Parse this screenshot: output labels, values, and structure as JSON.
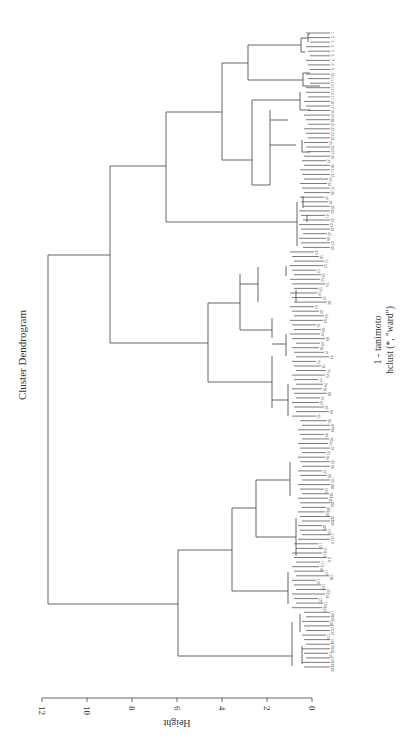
{
  "chart_data": {
    "type": "dendrogram",
    "orientation": "rotated 90 degrees clockwise (height axis runs horizontally at bottom, 12 on left to 0 on right; leaves on right edge)",
    "title": "Cluster Dendrogram",
    "xlabel": "1 - tanimoto",
    "sublabel": "hclust (*, \"ward\")",
    "ylabel": "Height",
    "ylim": [
      0,
      12
    ],
    "yticks": [
      0,
      2,
      4,
      6,
      8,
      10,
      12
    ],
    "ytick_labels": [
      "0",
      "2",
      "4",
      "6",
      "8",
      "10",
      "12"
    ],
    "grid": false,
    "legend": null,
    "approx_leaf_count": 140,
    "legible_leaf_labels": [
      "59",
      "82",
      "96",
      "107",
      "99"
    ],
    "merges": [
      {
        "id": "root",
        "height": 11.8,
        "children": [
          "A",
          "B"
        ]
      },
      {
        "id": "A",
        "height": 9.0,
        "children": [
          "A1",
          "A2"
        ]
      },
      {
        "id": "A1",
        "height": 6.5,
        "children": [
          "A1a",
          "A1b"
        ]
      },
      {
        "id": "A1a",
        "height": 4.0,
        "children": [
          "A1a-top",
          "A1a-bottom"
        ]
      },
      {
        "id": "A1a-top",
        "height": 2.8
      },
      {
        "id": "A1a-bottom",
        "height": 2.7
      },
      {
        "id": "A1b",
        "height": 0.7
      },
      {
        "id": "A2",
        "height": 4.6,
        "children": [
          "A2a",
          "A2b"
        ]
      },
      {
        "id": "A2a",
        "height": 3.2
      },
      {
        "id": "A2b",
        "height": 2.6
      },
      {
        "id": "B",
        "height": 5.9,
        "children": [
          "B1",
          "B2"
        ]
      },
      {
        "id": "B1",
        "height": 3.5,
        "children": [
          "B1a",
          "B1b"
        ]
      },
      {
        "id": "B1a",
        "height": 2.4
      },
      {
        "id": "B1b",
        "height": 1.0
      },
      {
        "id": "B2",
        "height": 0.85
      }
    ]
  },
  "labels": {
    "title": "Cluster Dendrogram",
    "xlabel": "1 - tanimoto",
    "sublabel": "hclust (*, \"ward\")",
    "ylabel": "Height",
    "ticks": [
      "12",
      "10",
      "8",
      "6",
      "4",
      "2",
      "0"
    ]
  },
  "leaf_labels_visible": [
    "59",
    "82",
    "96",
    "107",
    "99"
  ]
}
